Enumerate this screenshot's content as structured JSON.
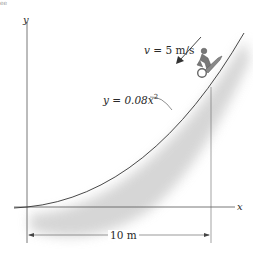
{
  "figure": {
    "corner_text": "ee",
    "axes": {
      "x_label": "x",
      "y_label": "y"
    },
    "velocity": {
      "symbol": "v",
      "text": " = 5 m/s",
      "value": 5,
      "unit": "m/s"
    },
    "curve_equation": {
      "prefix": "y = 0.08x",
      "exponent": "2"
    },
    "dimension": {
      "label": "10 m",
      "value": 10,
      "unit": "m"
    },
    "colors": {
      "line": "#3a3a3a",
      "shadow": "#cfcfcf",
      "rider": "#6e6e6e"
    }
  }
}
